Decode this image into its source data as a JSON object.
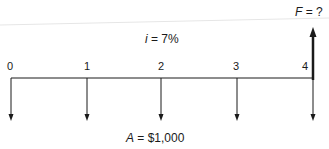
{
  "diagram": {
    "type": "cash-flow-diagram",
    "future_value_label": {
      "var": "F",
      "text": " = ?"
    },
    "interest_label": {
      "var": "i",
      "text": " = 7%"
    },
    "annuity_label": {
      "var": "A",
      "text": " = $1,000"
    },
    "periods": [
      {
        "label": "0",
        "x": 11
      },
      {
        "label": "1",
        "x": 87
      },
      {
        "label": "2",
        "x": 161
      },
      {
        "label": "3",
        "x": 237
      },
      {
        "label": "4",
        "x": 312
      }
    ],
    "cash_flows": [
      {
        "period": "0",
        "direction": "down",
        "amount": "$1,000"
      },
      {
        "period": "1",
        "direction": "down",
        "amount": "$1,000"
      },
      {
        "period": "2",
        "direction": "down",
        "amount": "$1,000"
      },
      {
        "period": "3",
        "direction": "down",
        "amount": "$1,000"
      },
      {
        "period": "4",
        "direction": "down",
        "amount": "$1,000"
      },
      {
        "period": "4",
        "direction": "up",
        "amount": "F = ?"
      }
    ],
    "colors": {
      "ink": "#1a1a1a",
      "background": "#ffffff",
      "artifact": "#e6e6e6"
    }
  }
}
